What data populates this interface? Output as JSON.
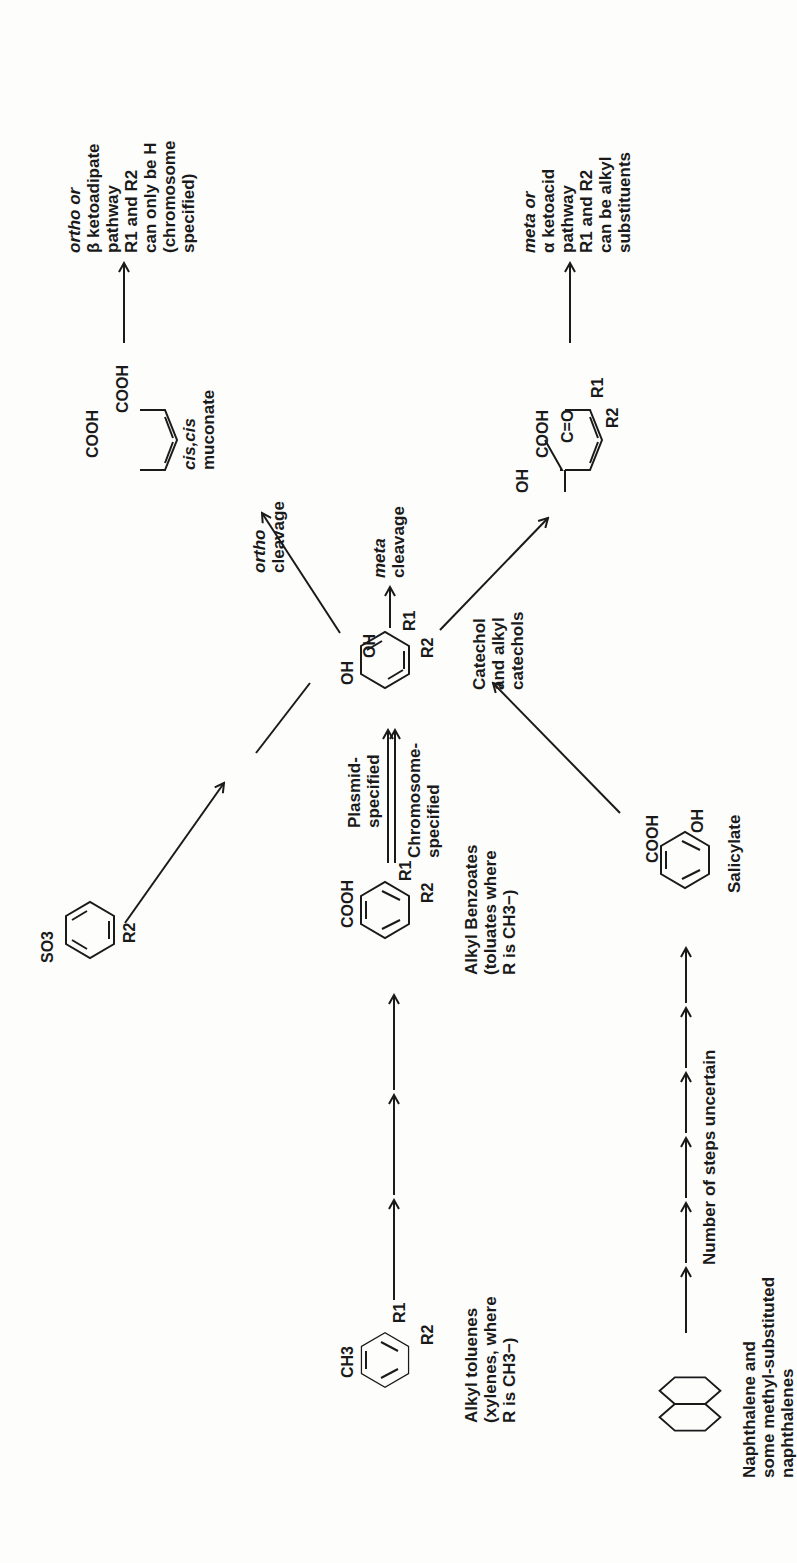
{
  "compounds": {
    "alkyl_toluene": {
      "substituent": "CH3",
      "r1": "R1",
      "r2": "R2",
      "label_lines": [
        "Alkyl toluenes",
        "(xylenes, where",
        "R is CH3−)"
      ]
    },
    "naphthalene": {
      "label_lines": [
        "Naphthalene and",
        "some methyl-substituted",
        "naphthalenes"
      ]
    },
    "alkyl_benzoate": {
      "substituent": "COOH",
      "r1": "R1",
      "r2": "R2",
      "label_lines": [
        "Alkyl Benzoates",
        "(toluates where",
        "R is CH3−)"
      ]
    },
    "salicylate": {
      "substituent1": "COOH",
      "substituent2": "OH",
      "label": "Salicylate"
    },
    "sulfonate": {
      "substituent": "SO3",
      "r2": "R2"
    },
    "catechol": {
      "oh1": "OH",
      "oh2": "OH",
      "r1": "R1",
      "r2": "R2",
      "label_lines": [
        "Catechol",
        "and alkyl",
        "catechols"
      ]
    },
    "muconate": {
      "cooh1": "COOH",
      "cooh2": "COOH",
      "label_lines": [
        "cis,cis",
        "muconate"
      ]
    },
    "meta_product": {
      "oh": "OH",
      "cooh": "COOH",
      "co": "C=O",
      "r1": "R1",
      "r2": "R2"
    }
  },
  "arrows": {
    "steps_uncertain_label": "Number of steps uncertain",
    "plasmid_label_lines": [
      "Plasmid-",
      "specified"
    ],
    "chromosome_label_lines": [
      "Chromosome-",
      "specified"
    ],
    "ortho_cleavage": {
      "italic": "ortho",
      "text": "cleavage"
    },
    "meta_cleavage": {
      "italic": "meta",
      "text": "cleavage"
    }
  },
  "pathways": {
    "ortho": {
      "lines": [
        "ortho or",
        "β ketoadipate",
        "pathway",
        "R1 and R2",
        "can only be H",
        "(chromosome",
        "specified)"
      ]
    },
    "meta": {
      "lines": [
        "meta or",
        "α ketoacid",
        "pathway",
        "R1 and R2",
        "can be alkyl",
        "substituents"
      ]
    }
  }
}
